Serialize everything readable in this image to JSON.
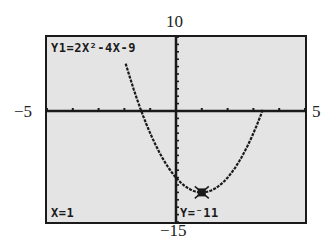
{
  "window": {
    "xmin_label": "−5",
    "xmax_label": "5",
    "ymin_label": "−15",
    "ymax_label": "10"
  },
  "screen": {
    "function_label": "Y1=2X²-4X-9",
    "x_readout": "X=1",
    "y_readout": "Y=⁻11",
    "background": "#e4e4e4",
    "ink": "#1a1a1a"
  },
  "chart_data": {
    "type": "line",
    "title": "Y1=2X²-4X-9",
    "function": "y = 2x^2 - 4x - 9",
    "xlim": [
      -5,
      5
    ],
    "ylim": [
      -15,
      10
    ],
    "xlabel": "",
    "ylabel": "",
    "x_tick_step": 1,
    "y_tick_step": 1,
    "grid": false,
    "cursor": {
      "x": 1,
      "y": -11
    },
    "series": [
      {
        "name": "Y1",
        "x": [
          -2,
          -1.5,
          -1,
          -0.5,
          0,
          0.5,
          1,
          1.5,
          2,
          2.5,
          3,
          3.5
        ],
        "values": [
          7,
          1.5,
          -3,
          -6.5,
          -9,
          -10.5,
          -11,
          -10.5,
          -9,
          -6.5,
          -3,
          1.5
        ]
      }
    ],
    "axis_window_labels": {
      "left": "-5",
      "right": "5",
      "top": "10",
      "bottom": "-15"
    }
  }
}
